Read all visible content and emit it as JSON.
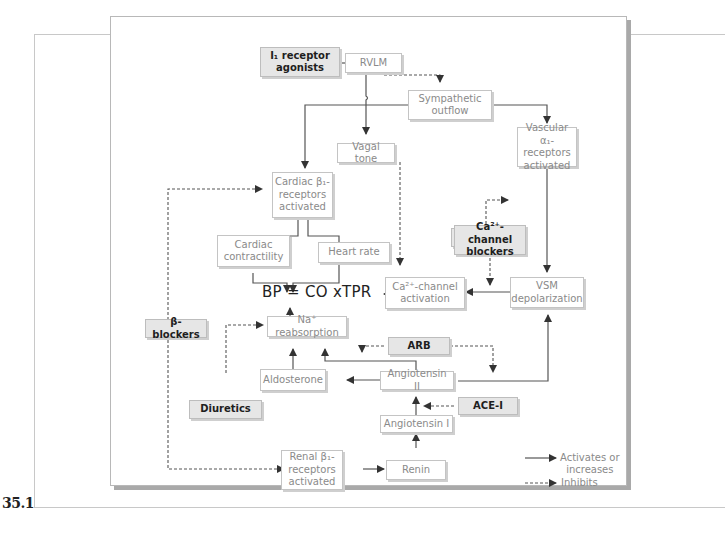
{
  "figure": {
    "label": "35.1",
    "title_equation": "BP = CO xTPR"
  },
  "nodes": {
    "i1_agonists": "I₁ receptor\nagonists",
    "rvlm": "RVLM",
    "sympathetic_outflow": "Sympathetic\noutflow",
    "vagal_tone": "Vagal tone",
    "vascular_alpha1": "Vascular α₁-\nreceptors\nactivated",
    "alpha1_blockers": "α₁-blockers",
    "cardiac_beta1": "Cardiac β₁-\nreceptors\nactivated",
    "cardiac_contractility": "Cardiac\ncontractility",
    "heart_rate": "Heart rate",
    "ca_blockers": "Ca²⁺-channel\nblockers",
    "ca_activation": "Ca²⁺-channel\nactivation",
    "vsm_depolarization": "VSM\ndepolarization",
    "beta_blockers": "β-blockers",
    "na_reabsorption": "Na⁺ reabsorption",
    "arb": "ARB",
    "aldosterone": "Aldosterone",
    "angiotensin_ii": "Angiotensin II",
    "ace_i": "ACE-I",
    "diuretics": "Diuretics",
    "angiotensin_i": "Angiotensin I",
    "renal_beta1": "Renal β₁-\nreceptors\nactivated",
    "renin": "Renin"
  },
  "legend": {
    "activates": "Activates or\nincreases",
    "inhibits": "Inhibits"
  },
  "colors": {
    "drug_fill": "#e6e6e6",
    "node_text": "#8a8a8a",
    "arrow": "#333333"
  }
}
